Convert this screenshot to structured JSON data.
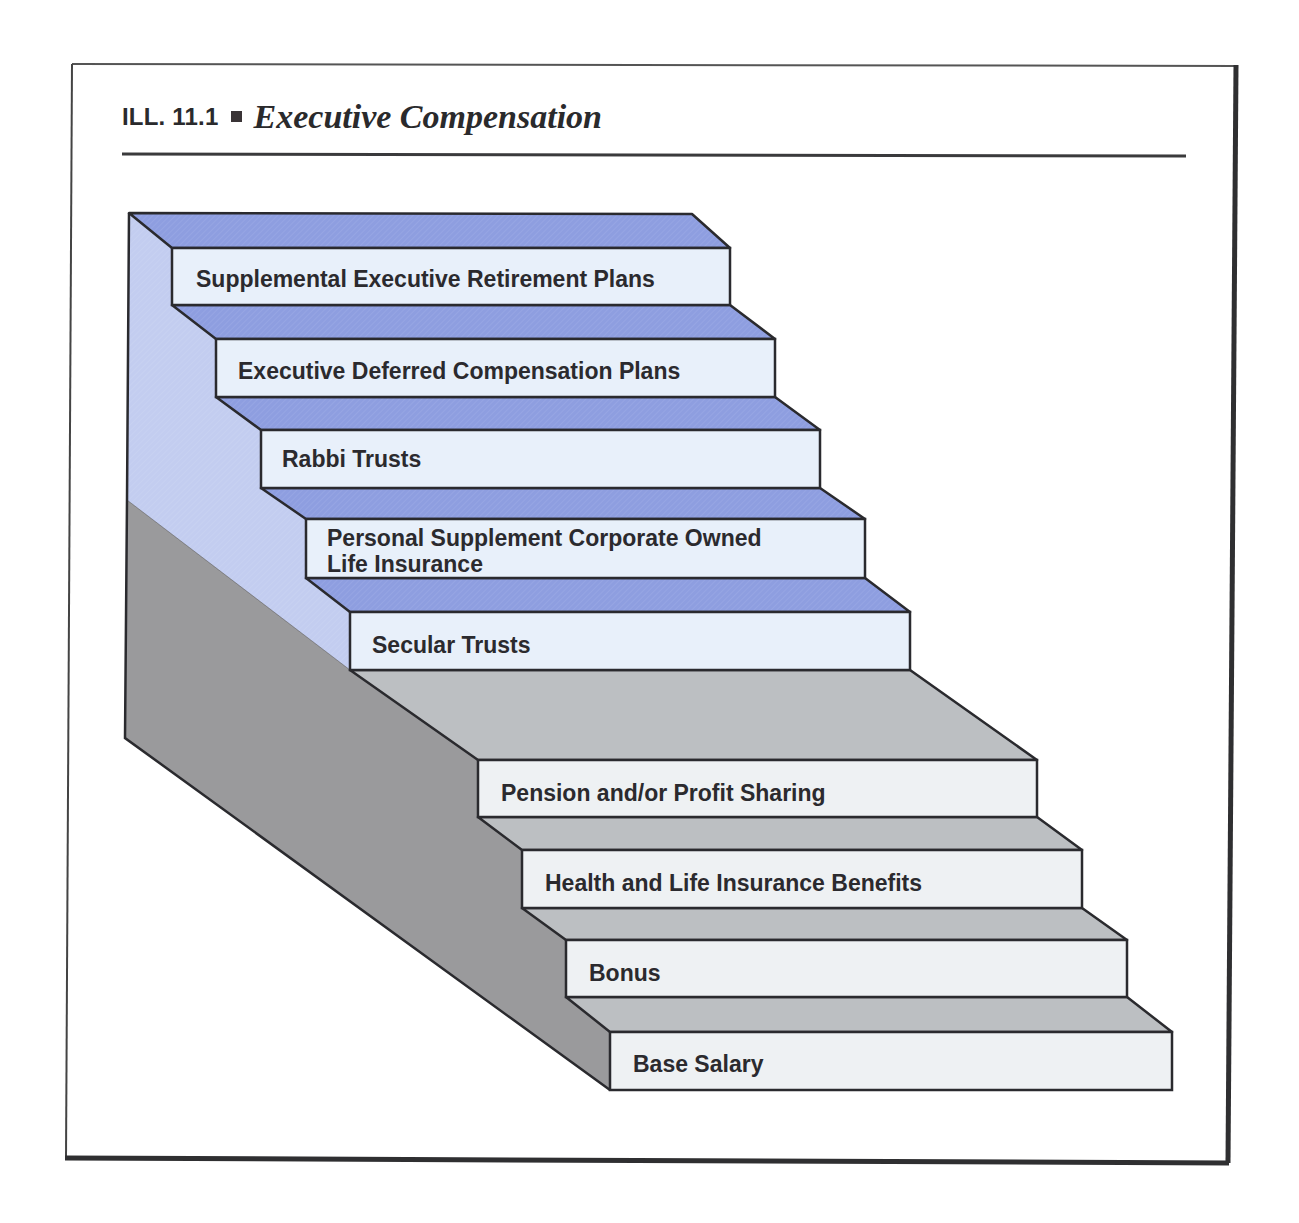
{
  "figure": {
    "number": "ILL. 11.1",
    "separator_icon": "square-bullet-icon",
    "title": "Executive Compensation"
  },
  "colors": {
    "frame": "#3a3a3c",
    "blue_tread": "#8e9ee0",
    "blue_side": "#c3cdf0",
    "blue_face": "#e8f0fa",
    "gray_tread": "#bcbfc2",
    "gray_side": "#9a9a9c",
    "gray_face": "#eef1f3",
    "outline": "#2a2a2e",
    "text": "#2b2a2e"
  },
  "steps": [
    {
      "label": "Supplemental Executive Retirement Plans",
      "tier": "executive"
    },
    {
      "label": "Executive Deferred Compensation Plans",
      "tier": "executive"
    },
    {
      "label": "Rabbi Trusts",
      "tier": "executive"
    },
    {
      "label_line1": "Personal Supplement Corporate Owned",
      "label_line2": "Life Insurance",
      "tier": "executive"
    },
    {
      "label": "Secular Trusts",
      "tier": "executive"
    },
    {
      "label": "Pension and/or Profit Sharing",
      "tier": "basic"
    },
    {
      "label": "Health and Life Insurance Benefits",
      "tier": "basic"
    },
    {
      "label": "Bonus",
      "tier": "basic"
    },
    {
      "label": "Base Salary",
      "tier": "basic"
    }
  ]
}
